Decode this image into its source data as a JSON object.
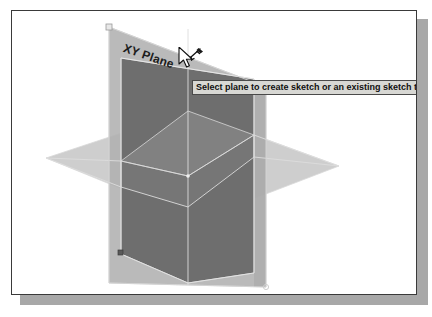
{
  "app": {
    "view_name": "3d-modeling-canvas"
  },
  "canvas": {
    "background_color": "#ffffff",
    "border_color": "#3a3a3a",
    "shadow_color": "#a8a8a8"
  },
  "scene": {
    "label": "XY Plane",
    "planes": [
      {
        "name": "horizontal-plane",
        "color": "#c9c9c9",
        "opacity": 0.85
      },
      {
        "name": "back-vertical-plane",
        "color": "#b4b4b4",
        "opacity": 0.9
      },
      {
        "name": "front-vertical-plane",
        "color": "#6e6e6e",
        "opacity": 0.95
      }
    ],
    "origin_marker": "origin-point",
    "handle_marker": "plane-corner-handle",
    "edge_color": "#d5d5d5"
  },
  "cursor": {
    "icon": "arrow-cursor-with-sketch-badge"
  },
  "tooltip": {
    "text": "Select plane to create sketch or an existing sketch to edit",
    "background_color": "#d8d8d4",
    "border_color": "#4a4a4a",
    "text_color": "#101010"
  }
}
